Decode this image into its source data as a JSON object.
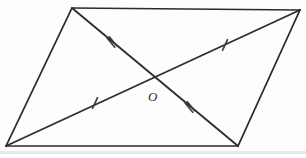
{
  "figure": {
    "kind": "parallelogram-with-diagonals",
    "canvas": {
      "width": 306,
      "height": 158
    },
    "colors": {
      "stroke": "#2b2b2b",
      "diagonal_stroke": "#2e2e2e",
      "tick_stroke": "#3a3a3a",
      "background": "#fdfdfd",
      "label_fill": "#2b2b2b"
    },
    "vertices": [
      {
        "name": "top-left",
        "x": 72,
        "y": 8
      },
      {
        "name": "top-right",
        "x": 300,
        "y": 10
      },
      {
        "name": "bottom-right",
        "x": 238,
        "y": 146
      },
      {
        "name": "bottom-left",
        "x": 6,
        "y": 146
      }
    ],
    "sides": [
      {
        "name": "top-side",
        "x1": 72,
        "y1": 8,
        "x2": 300,
        "y2": 10
      },
      {
        "name": "right-side",
        "x1": 300,
        "y1": 10,
        "x2": 238,
        "y2": 146
      },
      {
        "name": "bottom-side",
        "x1": 238,
        "y1": 146,
        "x2": 6,
        "y2": 146
      },
      {
        "name": "left-side",
        "x1": 6,
        "y1": 146,
        "x2": 72,
        "y2": 8
      }
    ],
    "diagonals": [
      {
        "name": "diagonal-top-left-to-bottom-right",
        "x1": 72,
        "y1": 8,
        "x2": 238,
        "y2": 146,
        "tick_count": 2
      },
      {
        "name": "diagonal-bottom-left-to-top-right",
        "x1": 6,
        "y1": 146,
        "x2": 300,
        "y2": 10,
        "tick_count": 1
      }
    ],
    "intersection": {
      "name": "center-point",
      "x": 155,
      "y": 77
    },
    "ticks": [
      {
        "name": "tick-double-upper-left",
        "x": 112,
        "y": 42,
        "count": 2,
        "angle": -39.7,
        "length": 13
      },
      {
        "name": "tick-double-lower-right",
        "x": 190,
        "y": 107,
        "count": 2,
        "angle": -39.7,
        "length": 13
      },
      {
        "name": "tick-single-lower-left",
        "x": 95,
        "y": 103,
        "count": 1,
        "angle": 24.8,
        "length": 13
      },
      {
        "name": "tick-single-upper-right",
        "x": 225,
        "y": 45,
        "count": 1,
        "angle": 24.8,
        "length": 13
      }
    ],
    "labels": [
      {
        "name": "center-point-label",
        "text": "O",
        "x": 148,
        "y": 101
      }
    ]
  }
}
